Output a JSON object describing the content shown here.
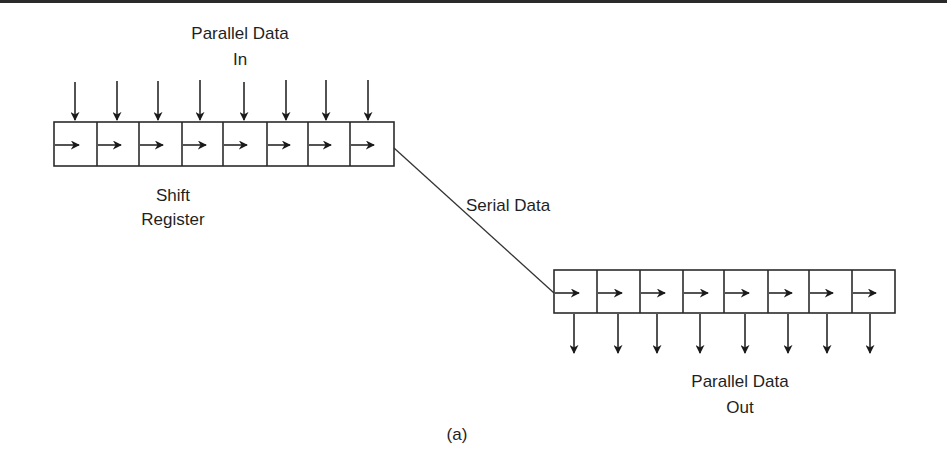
{
  "figure": {
    "caption": "(a)",
    "labels": {
      "parallel_in_line1": "Parallel Data",
      "parallel_in_line2": "In",
      "shift_register_line1": "Shift",
      "shift_register_line2": "Register",
      "serial_data": "Serial Data",
      "parallel_out_line1": "Parallel Data",
      "parallel_out_line2": "Out"
    },
    "input_register": {
      "cells": 8,
      "x": 54,
      "y": 122,
      "width": 340,
      "height": 44
    },
    "output_register": {
      "cells": 8,
      "x": 554,
      "y": 270,
      "width": 341,
      "height": 43
    },
    "serial_link": {
      "from": [
        394,
        148
      ],
      "to": [
        554,
        293
      ]
    },
    "colors": {
      "stroke": "#2b2b2b",
      "background": "#ffffff"
    }
  }
}
